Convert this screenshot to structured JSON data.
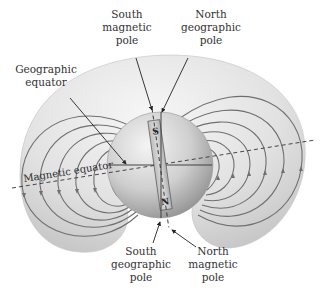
{
  "figure": {
    "labels": {
      "south_magnetic_pole": [
        "South",
        "magnetic",
        "pole"
      ],
      "north_geographic_pole": [
        "North",
        "geographic",
        "pole"
      ],
      "geographic_equator": [
        "Geographic",
        "equator"
      ],
      "magnetic_equator": "Magnetic equator",
      "south_geographic_pole": [
        "South",
        "geographic",
        "pole"
      ],
      "north_magnetic_pole": [
        "North",
        "magnetic",
        "pole"
      ]
    },
    "bar_magnet": {
      "top_label": "S",
      "bottom_label": "N"
    },
    "colors": {
      "torus_fill": "#dcdcdc",
      "torus_highlight": "#f2f2f2",
      "sphere_light": "#efefef",
      "sphere_dark": "#9a9a9a",
      "field_line": "#6f6f6f",
      "text": "#333333"
    }
  }
}
